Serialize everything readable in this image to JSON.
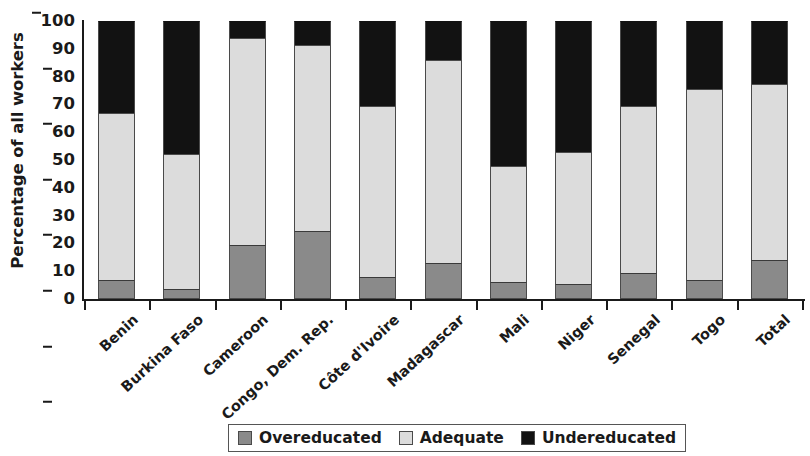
{
  "chart_data": {
    "type": "bar",
    "subtype": "stacked-bar-100-percent",
    "title": "",
    "xlabel": "",
    "ylabel": "Percentage of all workers",
    "ylim": [
      0,
      100
    ],
    "yticks": [
      0,
      10,
      20,
      30,
      40,
      50,
      60,
      70,
      80,
      90,
      100
    ],
    "ytick_labels": [
      "0",
      "10",
      "20",
      "30",
      "40",
      "50",
      "60",
      "70",
      "80",
      "90",
      "100"
    ],
    "grid": false,
    "legend_position": "bottom",
    "stack_order_bottom_to_top": [
      "Overeducated",
      "Adequate",
      "Undereducated"
    ],
    "categories": [
      "Benin",
      "Burkina Faso",
      "Cameroon",
      "Congo, Dem. Rep.",
      "Côte d'Ivoire",
      "Madagascar",
      "Mali",
      "Niger",
      "Senegal",
      "Togo",
      "Total"
    ],
    "series": [
      {
        "name": "Overeducated",
        "color": "#8a8a8a",
        "values": [
          7,
          3.5,
          19.5,
          24.5,
          8,
          13,
          6,
          5.5,
          9.5,
          7,
          14
        ]
      },
      {
        "name": "Adequate",
        "color": "#dcdcdc",
        "values": [
          60,
          48.5,
          74.5,
          67,
          61.5,
          73,
          42,
          47.5,
          60,
          68.5,
          63.5
        ]
      },
      {
        "name": "Undereducated",
        "color": "#121212",
        "values": [
          33,
          48,
          6,
          8.5,
          30.5,
          14,
          52,
          47,
          30.5,
          24.5,
          22.5
        ]
      }
    ],
    "cumulative_tops": {
      "overeducated": [
        7,
        3.5,
        19.5,
        24.5,
        8,
        13,
        6,
        5.5,
        9.5,
        7,
        14
      ],
      "adequate": [
        67,
        52,
        94,
        91.5,
        69.5,
        86,
        48,
        53,
        69.5,
        75.5,
        77.5
      ],
      "undereducated": [
        100,
        100,
        100,
        100,
        100,
        100,
        100,
        100,
        100,
        100,
        100
      ]
    }
  },
  "legend": {
    "items": [
      {
        "label": "Overeducated",
        "color": "#8a8a8a"
      },
      {
        "label": "Adequate",
        "color": "#dcdcdc"
      },
      {
        "label": "Undereducated",
        "color": "#121212"
      }
    ]
  }
}
